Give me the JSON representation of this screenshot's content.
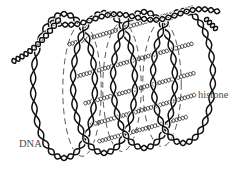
{
  "diagram": {
    "labels": {
      "dna": "DNA",
      "histone": "histone"
    },
    "colors": {
      "background": "#ffffff",
      "strand": "#111111",
      "rod": "#333333",
      "dashed": "#444444",
      "label": "#4a4a4a"
    },
    "dna_coils": [
      {
        "id": 1,
        "cx": 64,
        "cy": 86,
        "rx": 31,
        "ry": 72
      },
      {
        "id": 2,
        "cx": 104,
        "cy": 83,
        "rx": 31,
        "ry": 70
      },
      {
        "id": 3,
        "cx": 144,
        "cy": 80,
        "rx": 31,
        "ry": 68
      },
      {
        "id": 4,
        "cx": 183,
        "cy": 77,
        "rx": 30,
        "ry": 66
      }
    ],
    "histone_rods": [
      {
        "id": 1,
        "x1": 70,
        "y1": 46,
        "x2": 198,
        "y2": 8
      },
      {
        "id": 2,
        "x1": 78,
        "y1": 78,
        "x2": 198,
        "y2": 44
      },
      {
        "id": 3,
        "x1": 86,
        "y1": 105,
        "x2": 198,
        "y2": 74
      },
      {
        "id": 4,
        "x1": 90,
        "y1": 127,
        "x2": 198,
        "y2": 96
      },
      {
        "id": 5,
        "x1": 100,
        "y1": 143,
        "x2": 190,
        "y2": 118
      }
    ]
  }
}
